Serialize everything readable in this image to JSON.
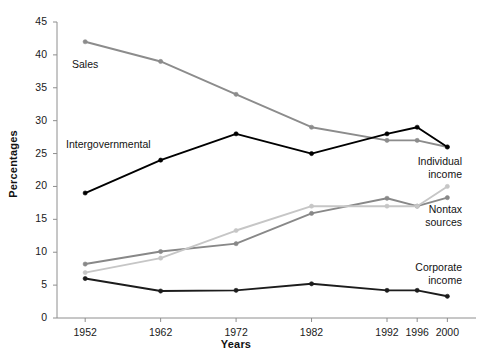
{
  "chart_data": {
    "type": "line",
    "title": "",
    "xlabel": "Years",
    "ylabel": "Percentages",
    "x": [
      1952,
      1962,
      1972,
      1982,
      1992,
      1996,
      2000
    ],
    "categories": [
      "1952",
      "1962",
      "1972",
      "1982",
      "1992",
      "1996",
      "2000"
    ],
    "xlim": [
      1948,
      2003
    ],
    "ylim": [
      0,
      45
    ],
    "yticks": [
      0,
      5,
      10,
      15,
      20,
      25,
      30,
      35,
      40,
      45
    ],
    "ytick_labels": [
      "0",
      "5",
      "10",
      "15",
      "20",
      "25",
      "30",
      "35",
      "40",
      "45"
    ],
    "grid": false,
    "legend_position": "inline-annotations",
    "markers": true,
    "series": [
      {
        "name": "Sales",
        "color": "#8c8c8c",
        "values": [
          42.0,
          39.0,
          34.0,
          29.0,
          27.0,
          27.0,
          26.0
        ]
      },
      {
        "name": "Intergovernmental",
        "color": "#000000",
        "values": [
          19.0,
          24.0,
          28.0,
          25.0,
          28.0,
          29.0,
          26.0
        ]
      },
      {
        "name": "Nontax sources",
        "color": "#888888",
        "values": [
          8.2,
          10.1,
          11.3,
          15.9,
          18.2,
          17.0,
          18.3
        ]
      },
      {
        "name": "Individual income",
        "color": "#c6c6c6",
        "values": [
          6.9,
          9.1,
          13.3,
          17.0,
          17.0,
          17.0,
          20.0
        ]
      },
      {
        "name": "Corporate income",
        "color": "#1c1c1c",
        "values": [
          6.0,
          4.1,
          4.2,
          5.2,
          4.2,
          4.2,
          3.3
        ]
      }
    ],
    "annotations": [
      {
        "text": "Sales",
        "series": "Sales"
      },
      {
        "text": "Intergovernmental",
        "series": "Intergovernmental"
      },
      {
        "text": "Individual",
        "series": "Individual income"
      },
      {
        "text": "income",
        "series": "Individual income"
      },
      {
        "text": "Nontax",
        "series": "Nontax sources"
      },
      {
        "text": "sources",
        "series": "Nontax sources"
      },
      {
        "text": "Corporate",
        "series": "Corporate income"
      },
      {
        "text": "income",
        "series": "Corporate income"
      }
    ]
  },
  "labels": {
    "sales": "Sales",
    "intergovernmental": "Intergovernmental",
    "individual_line1": "Individual",
    "individual_line2": "income",
    "nontax_line1": "Nontax",
    "nontax_line2": "sources",
    "corporate_line1": "Corporate",
    "corporate_line2": "income"
  },
  "axes": {
    "x_title": "Years",
    "y_title": "Percentages"
  },
  "colors": {
    "axis": "#8e8e8e",
    "text": "#121212",
    "background": "#ffffff"
  }
}
